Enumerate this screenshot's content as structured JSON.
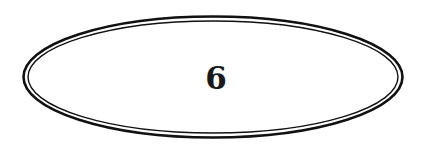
{
  "ornament": {
    "number": "6",
    "line_color": "#111111"
  }
}
